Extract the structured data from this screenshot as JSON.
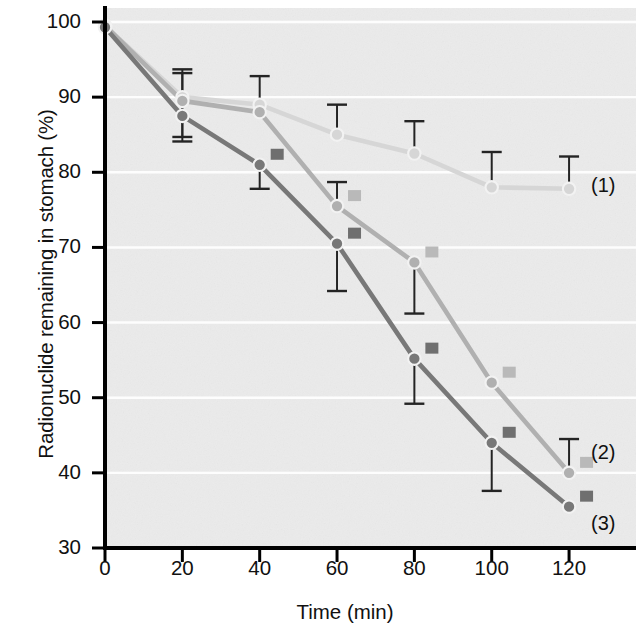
{
  "chart_data": {
    "type": "line",
    "title": "",
    "xlabel": "Time (min)",
    "ylabel": "Radionuclide remaining in stomach (%)",
    "x": [
      0,
      20,
      40,
      60,
      80,
      100,
      120
    ],
    "xlim": [
      0,
      128
    ],
    "ylim": [
      30,
      100
    ],
    "xticks": [
      0,
      20,
      40,
      60,
      80,
      100,
      120
    ],
    "yticks": [
      30,
      40,
      50,
      60,
      70,
      80,
      90,
      100
    ],
    "grid": "horizontal-white",
    "legend_position": "right-of-curve-ends",
    "plot_bg": "#ebebeb",
    "series": [
      {
        "name": "(1)",
        "label": "(1)",
        "color": "#d6d6d6",
        "marker": "circle-open",
        "values": [
          99.5,
          90.0,
          89.0,
          85.0,
          82.5,
          78.0,
          77.8
        ],
        "errors_up": [
          0.0,
          3.7,
          3.8,
          4.0,
          4.3,
          4.7,
          4.3
        ],
        "errors_down": [
          0.0,
          0.0,
          0.0,
          0.0,
          0.0,
          0.0,
          0.0
        ],
        "sig_markers": []
      },
      {
        "name": "(2)",
        "label": "(2)",
        "color": "#b0b0b0",
        "marker": "circle-filled-light",
        "values": [
          99.5,
          89.5,
          88.0,
          75.5,
          68.0,
          52.0,
          40.0
        ],
        "errors_up": [
          0.0,
          3.7,
          0.0,
          3.2,
          0.0,
          0.0,
          4.5
        ],
        "errors_down": [
          0.0,
          4.8,
          0.0,
          0.0,
          6.8,
          0.0,
          0.0
        ],
        "sig_markers": [
          60,
          80,
          100,
          120
        ]
      },
      {
        "name": "(3)",
        "label": "(3)",
        "color": "#787878",
        "marker": "circle-filled-dark",
        "values": [
          99.3,
          87.5,
          81.0,
          70.5,
          55.2,
          44.0,
          35.5
        ],
        "errors_up": [
          0.0,
          0.0,
          0.0,
          0.0,
          0.0,
          0.0,
          0.0
        ],
        "errors_down": [
          0.0,
          3.4,
          3.2,
          6.3,
          6.0,
          6.4,
          0.0
        ],
        "sig_markers": [
          40,
          60,
          80,
          100,
          120
        ]
      }
    ],
    "annotations": [
      {
        "text": "(1)",
        "x": 120,
        "y": 78.0
      },
      {
        "text": "(2)",
        "x": 120,
        "y": 42.5
      },
      {
        "text": "(3)",
        "x": 120,
        "y": 33.0
      }
    ]
  },
  "axes": {
    "x_title": "Time (min)",
    "y_title": "Radionuclide remaining in stomach (%)",
    "x_tick_labels": [
      "0",
      "20",
      "40",
      "60",
      "80",
      "100",
      "120"
    ],
    "y_tick_labels": [
      "30",
      "40",
      "50",
      "60",
      "70",
      "80",
      "90",
      "100"
    ]
  },
  "colors": {
    "axis": "#000000",
    "plot_background": "#ebebeb",
    "gridline": "#ffffff",
    "series1": "#d6d6d6",
    "series2": "#b0b0b0",
    "series3": "#787878",
    "errorbar": "#222222"
  }
}
